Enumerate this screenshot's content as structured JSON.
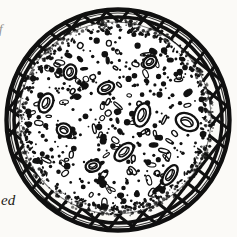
{
  "figure": {
    "name": "round-baked-good-on-cooling-rack",
    "medium": "black-and-white pen-and-ink line illustration",
    "background_color": "#fbfaf7",
    "ink_color": "#111111"
  },
  "page_text": {
    "fragment_left": "ed",
    "fragment_top_left": "f"
  },
  "rack": {
    "name": "wire-cooling-rack",
    "pattern": "diagonal cross-hatch lattice",
    "rim_style": "thick double-outlined ellipse ring",
    "center": {
      "x": 118,
      "y": 120
    },
    "radius_x": 113,
    "radius_y": 112,
    "rim_thickness": 9,
    "grid_spacing": 17,
    "grid_angle_deg": 38,
    "stroke_color": "#111111"
  },
  "baked_good": {
    "name": "baked-good",
    "center": {
      "x": 115,
      "y": 118
    },
    "radius": 95,
    "edge_style": "ragged crumbly speckled border",
    "fill_color": "#ffffff",
    "surface": "dense random dot stipple with scattered oval chunks",
    "dot_count": 330,
    "chunk_count": 96,
    "nugget_count": 13
  },
  "chart_data": {
    "type": "scatter",
    "title": "",
    "note": "decorative stipple distribution, not a data plot"
  }
}
